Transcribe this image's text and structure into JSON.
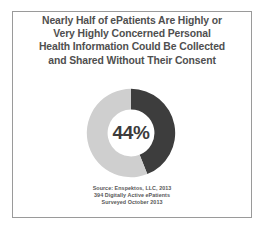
{
  "slide": {
    "background_color": "#ffffff",
    "border_color": "#9a9a9a"
  },
  "title": {
    "line1": "Nearly Half of ePatients Are Highly or",
    "line2": "Very Highly Concerned Personal",
    "line3": "Health Information Could Be Collected",
    "line4": "and Shared Without Their Consent",
    "color": "#4f4f4f"
  },
  "center_label": "44%",
  "source": {
    "line1": "Source: Enspektos, LLC, 2013",
    "line2": "394 Digitally Active ePatients",
    "line3": "Surveyed October 2013",
    "color": "#585858"
  },
  "chart_data": {
    "type": "pie",
    "variant": "donut",
    "title": "Nearly Half of ePatients Are Highly or Very Highly Concerned Personal Health Information Could Be Collected and Shared Without Their Consent",
    "categories": [
      "Highly or Very Highly Concerned",
      "Not Highly Concerned"
    ],
    "values": [
      44,
      56
    ],
    "value_unit": "%",
    "data_labels": [
      "44%",
      ""
    ],
    "colors": [
      "#3d3d3d",
      "#cfcfcf"
    ],
    "start_angle_deg": 0,
    "direction": "clockwise",
    "inner_radius_ratio": 0.53,
    "legend": "none",
    "grid": false
  }
}
